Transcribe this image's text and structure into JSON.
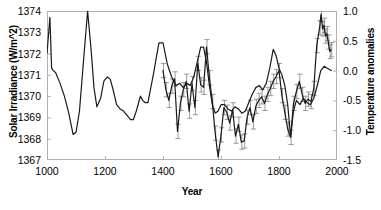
{
  "chart_data": {
    "type": "line",
    "title": "",
    "xlabel": "Year",
    "ylabel": "Solar Irradiance (W/m^2)",
    "ylabel_right": "Temperature anomalies",
    "xlim": [
      1000,
      2000
    ],
    "ylim": [
      1367,
      1374
    ],
    "ylim_right": [
      -1.5,
      1.0
    ],
    "xticks": [
      1000,
      1200,
      1400,
      1600,
      1800,
      2000
    ],
    "yticks_left": [
      1367,
      1368,
      1369,
      1370,
      1371,
      1372,
      1373,
      1374
    ],
    "yticks_right": [
      -1.5,
      -1.0,
      -0.5,
      0.0,
      0.5,
      1.0
    ],
    "grid": false,
    "legend": "none",
    "line_color": "#1a1a1a",
    "errorbar_color": "#808080",
    "frame_color": "#b0b0b0",
    "series": [
      {
        "name": "Solar Irradiance (W/m^2)",
        "axis": "left",
        "units": "W/m^2",
        "has_error_bars": false,
        "x": [
          1000,
          1010,
          1016,
          1022,
          1030,
          1045,
          1060,
          1075,
          1090,
          1100,
          1112,
          1125,
          1140,
          1152,
          1162,
          1172,
          1185,
          1196,
          1208,
          1218,
          1228,
          1240,
          1252,
          1264,
          1276,
          1288,
          1298,
          1308,
          1316,
          1322,
          1330,
          1338,
          1348,
          1358,
          1368,
          1378,
          1386,
          1400,
          1415,
          1430,
          1445,
          1458,
          1470,
          1482,
          1494,
          1506,
          1518,
          1530,
          1540,
          1550,
          1560,
          1570,
          1580,
          1590,
          1600,
          1612,
          1624,
          1636,
          1648,
          1660,
          1672,
          1684,
          1696,
          1708,
          1720,
          1732,
          1744,
          1756,
          1768,
          1780,
          1790,
          1800,
          1810,
          1820,
          1830,
          1840,
          1850,
          1860,
          1872,
          1884,
          1896,
          1908,
          1920,
          1932,
          1944,
          1956,
          1968,
          1980
        ],
        "y": [
          1372.0,
          1373.7,
          1371.3,
          1371.2,
          1371.1,
          1370.6,
          1370.0,
          1369.2,
          1368.2,
          1368.3,
          1369.3,
          1371.5,
          1374.0,
          1372.2,
          1370.4,
          1369.5,
          1369.9,
          1370.7,
          1370.9,
          1370.8,
          1370.3,
          1369.6,
          1369.4,
          1369.3,
          1369.1,
          1368.9,
          1368.9,
          1369.3,
          1369.7,
          1370.0,
          1369.8,
          1369.7,
          1369.7,
          1370.4,
          1371.1,
          1371.9,
          1372.5,
          1372.5,
          1371.5,
          1370.9,
          1370.5,
          1370.6,
          1370.4,
          1370.6,
          1370.5,
          1370.9,
          1371.6,
          1372.3,
          1372.3,
          1371.6,
          1370.5,
          1369.6,
          1369.2,
          1369.3,
          1369.6,
          1369.6,
          1369.4,
          1369.3,
          1369.5,
          1369.4,
          1369.2,
          1369.3,
          1369.7,
          1370.1,
          1370.4,
          1370.5,
          1370.3,
          1370.6,
          1371.3,
          1372.2,
          1371.9,
          1371.3,
          1371.0,
          1370.5,
          1369.6,
          1368.1,
          1369.3,
          1369.8,
          1369.6,
          1369.9,
          1369.7,
          1369.6,
          1369.9,
          1370.5,
          1371.2,
          1371.4,
          1371.3,
          1371.2
        ]
      },
      {
        "name": "Temperature anomalies",
        "axis": "right",
        "units": "degC",
        "has_error_bars": true,
        "x": [
          1400,
          1410,
          1420,
          1430,
          1440,
          1450,
          1460,
          1470,
          1480,
          1490,
          1500,
          1510,
          1520,
          1530,
          1540,
          1550,
          1560,
          1570,
          1580,
          1590,
          1600,
          1610,
          1620,
          1630,
          1640,
          1650,
          1660,
          1670,
          1680,
          1690,
          1700,
          1710,
          1720,
          1730,
          1740,
          1750,
          1760,
          1770,
          1780,
          1790,
          1800,
          1810,
          1820,
          1830,
          1840,
          1850,
          1860,
          1870,
          1880,
          1890,
          1900,
          1910,
          1920,
          1930,
          1940,
          1945,
          1950,
          1955,
          1960,
          1965,
          1970,
          1975,
          1980
        ],
        "y": [
          0.0,
          -0.32,
          -0.5,
          -0.26,
          -0.14,
          -1.02,
          -0.55,
          -0.32,
          -0.18,
          -0.68,
          -0.22,
          -0.62,
          0.12,
          -0.24,
          -0.28,
          0.4,
          -0.12,
          -0.52,
          -1.05,
          -1.45,
          -1.08,
          -0.62,
          -0.7,
          -0.88,
          -0.66,
          -1.1,
          -0.9,
          -1.2,
          -1.18,
          -0.78,
          -0.62,
          -0.86,
          -0.6,
          -0.5,
          -0.44,
          -0.55,
          -0.4,
          -0.3,
          -0.18,
          -0.1,
          0.0,
          -0.42,
          -0.7,
          -0.98,
          -1.12,
          -0.55,
          -0.35,
          -0.18,
          -0.4,
          -0.55,
          -0.48,
          -0.52,
          -0.3,
          0.42,
          0.72,
          0.95,
          0.7,
          0.76,
          0.58,
          0.62,
          0.48,
          0.32,
          0.35
        ],
        "error": 0.12
      }
    ]
  }
}
